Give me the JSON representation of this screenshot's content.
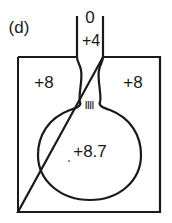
{
  "figure": {
    "panel_label": "(d)",
    "stroke_color": "#1a1a1a",
    "background": "#ffffff",
    "regions": {
      "tube_top": "0",
      "tube_mid": "+4",
      "box_left": "+8",
      "box_right": "+8",
      "bulb": "+8.7"
    },
    "neck_marker": "IIII"
  }
}
